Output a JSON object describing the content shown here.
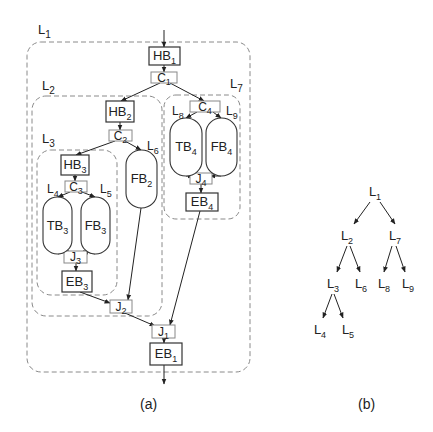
{
  "figure": {
    "panel_a": {
      "caption": "(a)",
      "loops": [
        {
          "id": "L1",
          "base": "L",
          "sub": "1",
          "x": 27,
          "y": 42,
          "w": 223,
          "h": 330,
          "r": 14,
          "lx": 38,
          "ly": 34
        },
        {
          "id": "L2",
          "base": "L",
          "sub": "2",
          "x": 32,
          "y": 96,
          "w": 130,
          "h": 220,
          "r": 14,
          "lx": 42,
          "ly": 90
        },
        {
          "id": "L3",
          "base": "L",
          "sub": "3",
          "x": 37,
          "y": 150,
          "w": 80,
          "h": 145,
          "r": 14,
          "lx": 42,
          "ly": 143
        },
        {
          "id": "L7",
          "base": "L",
          "sub": "7",
          "x": 164,
          "y": 95,
          "w": 76,
          "h": 124,
          "r": 12,
          "lx": 230,
          "ly": 88
        }
      ],
      "blocks": [
        {
          "id": "HB1",
          "base": "HB",
          "sub": "1",
          "x": 149,
          "y": 47,
          "w": 31,
          "h": 18
        },
        {
          "id": "HB2",
          "base": "HB",
          "sub": "2",
          "x": 106,
          "y": 101,
          "w": 28,
          "h": 21
        },
        {
          "id": "HB3",
          "base": "HB",
          "sub": "3",
          "x": 61,
          "y": 155,
          "w": 28,
          "h": 20
        },
        {
          "id": "EB3",
          "base": "EB",
          "sub": "3",
          "x": 62,
          "y": 271,
          "w": 30,
          "h": 21
        },
        {
          "id": "EB4",
          "base": "EB",
          "sub": "4",
          "x": 186,
          "y": 193,
          "w": 32,
          "h": 18
        },
        {
          "id": "EB1",
          "base": "EB",
          "sub": "1",
          "x": 150,
          "y": 343,
          "w": 32,
          "h": 22
        }
      ],
      "splits": [
        {
          "id": "C1",
          "base": "C",
          "sub": "1",
          "x": 151,
          "y": 72,
          "w": 26,
          "h": 11
        },
        {
          "id": "C2",
          "base": "C",
          "sub": "2",
          "x": 109,
          "y": 130,
          "w": 23,
          "h": 11
        },
        {
          "id": "C3",
          "base": "C",
          "sub": "3",
          "x": 65,
          "y": 181,
          "w": 22,
          "h": 11
        },
        {
          "id": "C4",
          "base": "C",
          "sub": "4",
          "x": 190,
          "y": 101,
          "w": 30,
          "h": 11
        },
        {
          "id": "J3",
          "base": "J",
          "sub": "3",
          "x": 64,
          "y": 251,
          "w": 23,
          "h": 12
        },
        {
          "id": "J4",
          "base": "J",
          "sub": "4",
          "x": 190,
          "y": 173,
          "w": 22,
          "h": 11
        },
        {
          "id": "J2",
          "base": "J",
          "sub": "2",
          "x": 110,
          "y": 300,
          "w": 22,
          "h": 13
        },
        {
          "id": "J1",
          "base": "J",
          "sub": "1",
          "x": 152,
          "y": 325,
          "w": 23,
          "h": 13
        }
      ],
      "branches": [
        {
          "id": "TB3",
          "base": "TB",
          "sub": "3",
          "x": 43,
          "y": 197,
          "w": 29,
          "h": 57,
          "loop": "L4",
          "lx": 47,
          "ly": 193
        },
        {
          "id": "FB3",
          "base": "FB",
          "sub": "3",
          "x": 81,
          "y": 197,
          "w": 29,
          "h": 57,
          "loop": "L5",
          "lx": 100,
          "ly": 193
        },
        {
          "id": "FB2",
          "base": "FB",
          "sub": "2",
          "x": 126,
          "y": 150,
          "w": 31,
          "h": 58,
          "loop": "L6",
          "lx": 147,
          "ly": 150
        },
        {
          "id": "TB4",
          "base": "TB",
          "sub": "4",
          "x": 170,
          "y": 118,
          "w": 32,
          "h": 58,
          "loop": "L8",
          "lx": 172,
          "ly": 115
        },
        {
          "id": "FB4",
          "base": "FB",
          "sub": "4",
          "x": 206,
          "y": 118,
          "w": 31,
          "h": 58,
          "loop": "L9",
          "lx": 226,
          "ly": 115
        }
      ],
      "edges": [
        {
          "from": "in",
          "x1": 164,
          "y1": 30,
          "x2": 164,
          "y2": 47
        },
        {
          "from": "HB1",
          "to": "C1",
          "x1": 164,
          "y1": 65,
          "x2": 164,
          "y2": 72
        },
        {
          "from": "C1",
          "to": "HB2",
          "x1": 160,
          "y1": 83,
          "x2": 121,
          "y2": 101
        },
        {
          "from": "C1",
          "to": "C4",
          "x1": 170,
          "y1": 83,
          "x2": 204,
          "y2": 101
        },
        {
          "from": "HB2",
          "to": "C2",
          "x1": 120,
          "y1": 122,
          "x2": 120,
          "y2": 130
        },
        {
          "from": "C2",
          "to": "HB3",
          "x1": 115,
          "y1": 141,
          "x2": 76,
          "y2": 155
        },
        {
          "from": "C2",
          "to": "FB2",
          "x1": 125,
          "y1": 141,
          "x2": 141,
          "y2": 150
        },
        {
          "from": "HB3",
          "to": "C3",
          "x1": 75,
          "y1": 175,
          "x2": 75,
          "y2": 181
        },
        {
          "from": "C3",
          "to": "TB3",
          "x1": 70,
          "y1": 192,
          "x2": 58,
          "y2": 197
        },
        {
          "from": "C3",
          "to": "FB3",
          "x1": 82,
          "y1": 192,
          "x2": 95,
          "y2": 197
        },
        {
          "from": "TB3",
          "to": "J3",
          "x1": 58,
          "y1": 254,
          "x2": 69,
          "y2": 251
        },
        {
          "from": "FB3",
          "to": "J3",
          "x1": 95,
          "y1": 254,
          "x2": 83,
          "y2": 251
        },
        {
          "from": "J3",
          "to": "EB3",
          "x1": 76,
          "y1": 263,
          "x2": 76,
          "y2": 271
        },
        {
          "from": "EB3",
          "to": "J2",
          "x1": 80,
          "y1": 292,
          "x2": 110,
          "y2": 303
        },
        {
          "from": "FB2",
          "to": "J2",
          "x1": 141,
          "y1": 208,
          "x2": 128,
          "y2": 300
        },
        {
          "from": "C4",
          "to": "TB4",
          "x1": 197,
          "y1": 112,
          "x2": 186,
          "y2": 118
        },
        {
          "from": "C4",
          "to": "FB4",
          "x1": 213,
          "y1": 112,
          "x2": 221,
          "y2": 118
        },
        {
          "from": "TB4",
          "to": "J4",
          "x1": 186,
          "y1": 176,
          "x2": 193,
          "y2": 176
        },
        {
          "from": "FB4",
          "to": "J4",
          "x1": 221,
          "y1": 176,
          "x2": 210,
          "y2": 176
        },
        {
          "from": "J4",
          "to": "EB4",
          "x1": 201,
          "y1": 184,
          "x2": 201,
          "y2": 193
        },
        {
          "from": "J2",
          "to": "J1",
          "x1": 125,
          "y1": 313,
          "x2": 155,
          "y2": 326
        },
        {
          "from": "EB4",
          "to": "J1",
          "x1": 200,
          "y1": 211,
          "x2": 170,
          "y2": 325
        },
        {
          "from": "J1",
          "to": "EB1",
          "x1": 164,
          "y1": 338,
          "x2": 164,
          "y2": 343
        },
        {
          "from": "EB1",
          "to": "out",
          "x1": 164,
          "y1": 365,
          "x2": 164,
          "y2": 384
        }
      ]
    },
    "panel_b": {
      "caption": "(b)",
      "nodes": [
        {
          "id": "L1",
          "base": "L",
          "sub": "1",
          "x": 375,
          "y": 196
        },
        {
          "id": "L2",
          "base": "L",
          "sub": "2",
          "x": 347,
          "y": 240
        },
        {
          "id": "L7",
          "base": "L",
          "sub": "7",
          "x": 395,
          "y": 240
        },
        {
          "id": "L3",
          "base": "L",
          "sub": "3",
          "x": 333,
          "y": 288
        },
        {
          "id": "L6",
          "base": "L",
          "sub": "6",
          "x": 361,
          "y": 288
        },
        {
          "id": "L8",
          "base": "L",
          "sub": "8",
          "x": 384,
          "y": 288
        },
        {
          "id": "L9",
          "base": "L",
          "sub": "9",
          "x": 408,
          "y": 288
        },
        {
          "id": "L4",
          "base": "L",
          "sub": "4",
          "x": 320,
          "y": 334
        },
        {
          "id": "L5",
          "base": "L",
          "sub": "5",
          "x": 348,
          "y": 334
        }
      ],
      "edges": [
        {
          "from": "L1",
          "to": "L2",
          "x1": 370,
          "y1": 202,
          "x2": 354,
          "y2": 224
        },
        {
          "from": "L1",
          "to": "L7",
          "x1": 380,
          "y1": 202,
          "x2": 395,
          "y2": 224
        },
        {
          "from": "L2",
          "to": "L3",
          "x1": 347,
          "y1": 246,
          "x2": 337,
          "y2": 272
        },
        {
          "from": "L2",
          "to": "L6",
          "x1": 350,
          "y1": 246,
          "x2": 360,
          "y2": 272
        },
        {
          "from": "L7",
          "to": "L8",
          "x1": 392,
          "y1": 246,
          "x2": 384,
          "y2": 272
        },
        {
          "from": "L7",
          "to": "L9",
          "x1": 396,
          "y1": 246,
          "x2": 405,
          "y2": 272
        },
        {
          "from": "L3",
          "to": "L4",
          "x1": 332,
          "y1": 294,
          "x2": 323,
          "y2": 318
        },
        {
          "from": "L3",
          "to": "L5",
          "x1": 334,
          "y1": 294,
          "x2": 343,
          "y2": 318
        }
      ]
    },
    "colors": {
      "stroke": "#222222",
      "dashed": "#8a8a8a",
      "split_box": "#888888"
    }
  }
}
